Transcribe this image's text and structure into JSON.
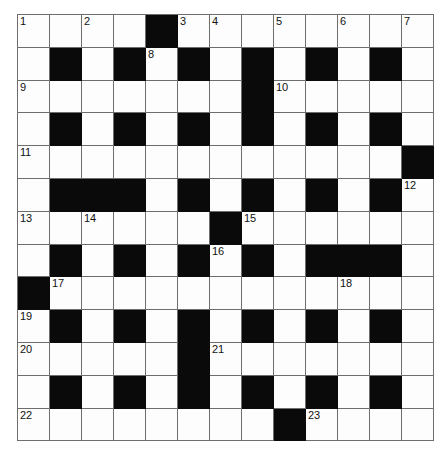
{
  "puzzle": {
    "title": "Crossword Grid",
    "type": "crossword",
    "rows": 13,
    "columns": 13,
    "colors": {
      "block": "#0a0a0a",
      "open": "#fdfdfd",
      "grid_line": "#6e6e6e",
      "number_text": "#111111",
      "background": "#ffffff"
    },
    "grid": [
      [
        "open",
        "open",
        "open",
        "open",
        "block",
        "open",
        "open",
        "open",
        "open",
        "open",
        "open",
        "open",
        "open"
      ],
      [
        "open",
        "block",
        "open",
        "block",
        "open",
        "block",
        "open",
        "block",
        "open",
        "block",
        "open",
        "block",
        "open"
      ],
      [
        "open",
        "open",
        "open",
        "open",
        "open",
        "open",
        "open",
        "block",
        "open",
        "open",
        "open",
        "open",
        "open"
      ],
      [
        "open",
        "block",
        "open",
        "block",
        "open",
        "block",
        "open",
        "block",
        "open",
        "block",
        "open",
        "block",
        "open"
      ],
      [
        "open",
        "open",
        "open",
        "open",
        "open",
        "open",
        "open",
        "open",
        "open",
        "open",
        "open",
        "open",
        "block"
      ],
      [
        "open",
        "block",
        "block",
        "block",
        "open",
        "block",
        "open",
        "block",
        "open",
        "block",
        "open",
        "block",
        "open"
      ],
      [
        "open",
        "open",
        "open",
        "open",
        "open",
        "open",
        "block",
        "open",
        "open",
        "open",
        "open",
        "open",
        "open"
      ],
      [
        "open",
        "block",
        "open",
        "block",
        "open",
        "block",
        "open",
        "block",
        "open",
        "block",
        "block",
        "block",
        "open"
      ],
      [
        "block",
        "open",
        "open",
        "open",
        "open",
        "open",
        "open",
        "open",
        "open",
        "open",
        "open",
        "open",
        "open"
      ],
      [
        "open",
        "block",
        "open",
        "block",
        "open",
        "block",
        "open",
        "block",
        "open",
        "block",
        "open",
        "block",
        "open"
      ],
      [
        "open",
        "open",
        "open",
        "open",
        "open",
        "block",
        "open",
        "open",
        "open",
        "open",
        "open",
        "open",
        "open"
      ],
      [
        "open",
        "block",
        "open",
        "block",
        "open",
        "block",
        "open",
        "block",
        "open",
        "block",
        "open",
        "block",
        "open"
      ],
      [
        "open",
        "open",
        "open",
        "open",
        "open",
        "open",
        "open",
        "open",
        "block",
        "open",
        "open",
        "open",
        "open"
      ]
    ],
    "numbers": [
      {
        "row": 0,
        "col": 0,
        "label": "1"
      },
      {
        "row": 0,
        "col": 2,
        "label": "2"
      },
      {
        "row": 0,
        "col": 5,
        "label": "3"
      },
      {
        "row": 0,
        "col": 6,
        "label": "4"
      },
      {
        "row": 0,
        "col": 8,
        "label": "5"
      },
      {
        "row": 0,
        "col": 10,
        "label": "6"
      },
      {
        "row": 0,
        "col": 12,
        "label": "7"
      },
      {
        "row": 1,
        "col": 4,
        "label": "8"
      },
      {
        "row": 2,
        "col": 0,
        "label": "9"
      },
      {
        "row": 2,
        "col": 8,
        "label": "10"
      },
      {
        "row": 4,
        "col": 0,
        "label": "11"
      },
      {
        "row": 5,
        "col": 12,
        "label": "12"
      },
      {
        "row": 6,
        "col": 0,
        "label": "13"
      },
      {
        "row": 6,
        "col": 2,
        "label": "14"
      },
      {
        "row": 6,
        "col": 7,
        "label": "15"
      },
      {
        "row": 7,
        "col": 6,
        "label": "16"
      },
      {
        "row": 8,
        "col": 1,
        "label": "17"
      },
      {
        "row": 8,
        "col": 10,
        "label": "18"
      },
      {
        "row": 9,
        "col": 0,
        "label": "19"
      },
      {
        "row": 10,
        "col": 0,
        "label": "20"
      },
      {
        "row": 10,
        "col": 6,
        "label": "21"
      },
      {
        "row": 12,
        "col": 0,
        "label": "22"
      },
      {
        "row": 12,
        "col": 9,
        "label": "23"
      }
    ]
  }
}
